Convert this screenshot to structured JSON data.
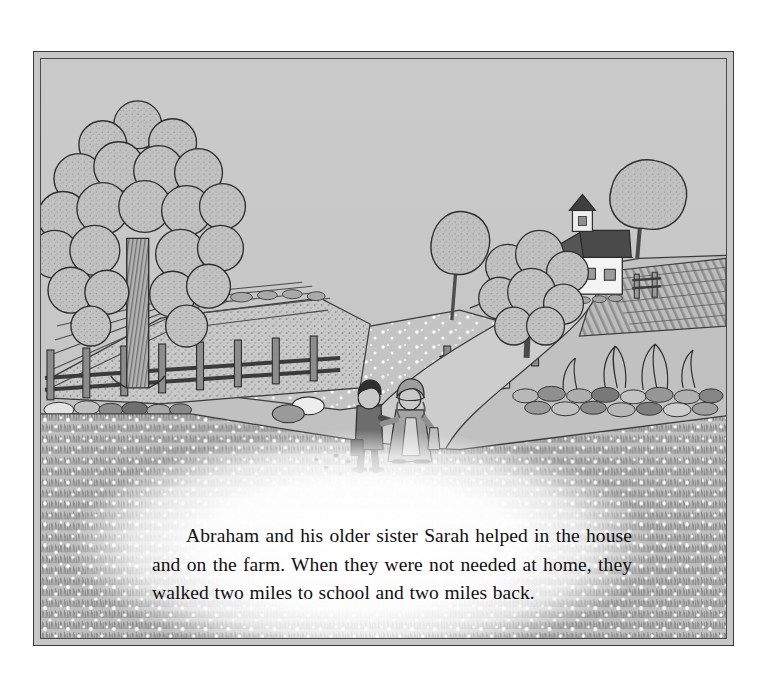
{
  "page": {
    "kind": "picture-book-page",
    "background_color": "#ffffff"
  },
  "illustration": {
    "name": "farm-landscape-with-two-children-walking-to-school",
    "frame_style": "double-rule-rectangle",
    "frame_color": "#3a3a3a",
    "sky_color": "#c7c7c7",
    "ground_color": "#c0c0c0",
    "ink_color": "#2b2b2b",
    "elements": [
      {
        "name": "sky",
        "description": "flat light gray sky filling upper portion of the frame"
      },
      {
        "name": "large-tree-left",
        "description": "tall broadleaf tree with scalloped cloud-like foliage and a hatched vertical trunk at the left edge"
      },
      {
        "name": "crop-field-rows",
        "description": "terraced garden rows of stippled crops rising behind the split-rail fence"
      },
      {
        "name": "split-rail-fence",
        "description": "post and rail wooden fence running across the left middle ground"
      },
      {
        "name": "dirt-road",
        "description": "pale winding dirt road curving from the lower right up the hill to the schoolhouse"
      },
      {
        "name": "schoolhouse",
        "description": "white clapboard one-room schoolhouse with dark gabled roof, bell cupola, front door with steps and two windows"
      },
      {
        "name": "schoolhouse-bell-tower",
        "description": "small square cupola with dark pointed roof on the schoolhouse ridge"
      },
      {
        "name": "tree-near-schoolhouse",
        "description": "round-crowned tree standing just right of the schoolhouse"
      },
      {
        "name": "center-trees",
        "description": "pair of trees on the central hill, one slender and one full-crowned"
      },
      {
        "name": "stone-wall",
        "description": "low dry-stone wall of rounded stones bounding the flowering meadow"
      },
      {
        "name": "plowed-field-right",
        "description": "striped plowed field rows on the far right hillside"
      },
      {
        "name": "shrubs-right",
        "description": "cluster of bare-branched shrubs above the right stone wall"
      },
      {
        "name": "flower-meadow",
        "description": "dense stippled foreground meadow of grass speckled with small white flowers"
      },
      {
        "name": "boy-abraham",
        "description": "young boy in dark jacket and trousers carrying a satchel, holding his sister's hand"
      },
      {
        "name": "girl-sarah",
        "description": "older girl in a bonnet and long dress with an apron, holding her brother's hand"
      },
      {
        "name": "chickens",
        "description": "a few tiny birds pecking on the road beside the children"
      }
    ]
  },
  "caption": {
    "text": "Abraham and his older sister Sarah helped in the house and on the farm. When they were not needed at home, they walked two miles to school and two miles back."
  }
}
